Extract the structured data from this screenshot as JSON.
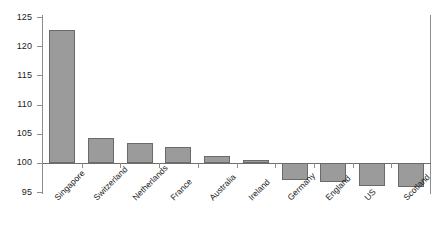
{
  "chart_data": {
    "type": "bar",
    "title": "",
    "subtitle": "",
    "xlabel": "",
    "ylabel": "",
    "categories": [
      "Singapore",
      "Switzerland",
      "Netherlands",
      "France",
      "Australia",
      "Ireland",
      "Germany",
      "England",
      "US",
      "Scotland"
    ],
    "values": [
      122.8,
      104.2,
      103.4,
      102.8,
      101.2,
      100.5,
      97.1,
      96.7,
      96.0,
      95.8
    ],
    "baseline": 100,
    "ylim": [
      95,
      125
    ],
    "ytick_labels": [
      "125",
      "120",
      "115",
      "110",
      "105",
      "100",
      "95"
    ],
    "ytick_values": [
      125,
      120,
      115,
      110,
      105,
      100,
      95
    ],
    "grid": false,
    "legend": null,
    "bar_color": "#9b9b9b",
    "bar_border_color": "#6a6a6a",
    "axis_color": "#8c8c8c",
    "text_color": "#1a1a1a"
  }
}
